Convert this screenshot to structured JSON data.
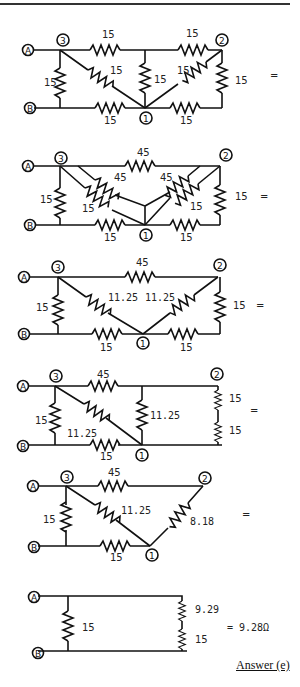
{
  "diagrams": [
    {
      "id": "step1",
      "resistors": {
        "r_top_left": "15",
        "r_top_right": "15",
        "r_left": "15",
        "r_diag_left": "15",
        "r_mid": "15",
        "r_diag_right": "15",
        "r_right": "15",
        "r_bot_left": "15",
        "r_bot_right": "15"
      },
      "nodes": {
        "a": "A",
        "b": "B",
        "n1": "1",
        "n2": "2",
        "n3": "3"
      },
      "equals": "="
    },
    {
      "id": "step2",
      "resistors": {
        "r_top": "45",
        "r_left": "15",
        "r_wye_left_top": "45",
        "r_wye_left_bot": "15",
        "r_wye_right_top": "45",
        "r_wye_right_bot": "15",
        "r_right": "15",
        "r_bot_left": "15",
        "r_bot_right": "15"
      },
      "nodes": {
        "a": "A",
        "b": "B",
        "n1": "1",
        "n2": "2",
        "n3": "3"
      },
      "equals": "="
    },
    {
      "id": "step3",
      "resistors": {
        "r_top": "45",
        "r_left": "15",
        "r_diag_left": "11.25",
        "r_diag_right": "11.25",
        "r_right": "15",
        "r_bot_left": "15",
        "r_bot_right": "15"
      },
      "nodes": {
        "a": "A",
        "b": "B",
        "n1": "1",
        "n2": "2",
        "n3": "3"
      },
      "equals": "="
    },
    {
      "id": "step4",
      "resistors": {
        "r_top": "45",
        "r_left": "15",
        "r_diag": "11.25",
        "r_mid": "11.25",
        "r_right_top": "15",
        "r_right_bot": "15",
        "r_bot": "15"
      },
      "nodes": {
        "a": "A",
        "b": "B",
        "n1": "1",
        "n2": "2",
        "n3": "3"
      },
      "equals": "="
    },
    {
      "id": "step5",
      "resistors": {
        "r_top": "45",
        "r_left": "15",
        "r_diag": "11.25",
        "r_right": "8.18",
        "r_bot": "15"
      },
      "nodes": {
        "a": "A",
        "b": "B",
        "n1": "1",
        "n2": "2",
        "n3": "3"
      },
      "equals": "="
    },
    {
      "id": "step6",
      "resistors": {
        "r_left": "15",
        "r_right_top": "9.29",
        "r_right_bot": "15"
      },
      "nodes": {
        "a": "A",
        "b": "B"
      },
      "result": "= 9.28Ω"
    }
  ],
  "answer": "Answer (e)"
}
